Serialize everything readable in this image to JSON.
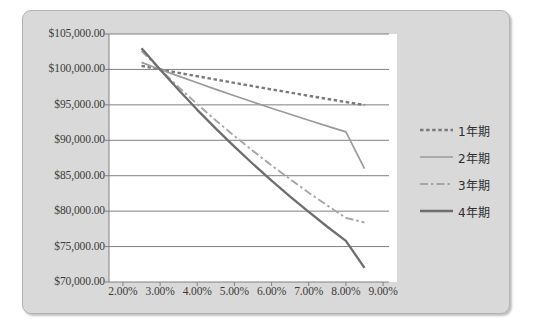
{
  "chart_data": {
    "type": "line",
    "title": "",
    "xlabel": "",
    "ylabel": "",
    "xlim": [
      1.625,
      9.375
    ],
    "ylim": [
      70000,
      105000
    ],
    "grid": true,
    "legend_position": "right",
    "x_ticks": [
      "2.00%",
      "3.00%",
      "4.00%",
      "5.00%",
      "6.00%",
      "7.00%",
      "8.00%",
      "9.00%"
    ],
    "x_tick_values": [
      2,
      3,
      4,
      5,
      6,
      7,
      8,
      9
    ],
    "y_ticks": [
      "$70,000.00",
      "$75,000.00",
      "$80,000.00",
      "$85,000.00",
      "$90,000.00",
      "$95,000.00",
      "$100,000.00",
      "$105,000.00"
    ],
    "y_tick_values": [
      70000,
      75000,
      80000,
      85000,
      90000,
      95000,
      100000,
      105000
    ],
    "x": [
      2.5,
      3.0,
      3.5,
      4.0,
      4.5,
      5.0,
      5.5,
      6.0,
      6.5,
      7.0,
      7.5,
      8.0,
      8.5
    ],
    "series": [
      {
        "name": "1年期",
        "style": "dotted",
        "color": "#7a7a7a",
        "values": [
          100500,
          100000,
          99520,
          99040,
          98570,
          98100,
          97640,
          97180,
          96730,
          96280,
          95840,
          95400,
          94970
        ]
      },
      {
        "name": "2年期",
        "style": "solid-light",
        "color": "#9a9a9a",
        "values": [
          101000,
          100000,
          99050,
          98110,
          97190,
          96290,
          95400,
          94530,
          93670,
          92830,
          92000,
          91190,
          86000
        ]
      },
      {
        "name": "3年期",
        "style": "dash-dot",
        "color": "#a6a6a6",
        "values": [
          102600,
          100000,
          97500,
          95100,
          92800,
          90600,
          88500,
          86450,
          84500,
          82600,
          80800,
          79050,
          78400
        ]
      },
      {
        "name": "4年期",
        "style": "solid-dark",
        "color": "#6e6e6e",
        "values": [
          103000,
          100000,
          97100,
          94300,
          91650,
          89100,
          86650,
          84300,
          82050,
          79900,
          77800,
          75800,
          72000
        ]
      }
    ]
  },
  "legend": {
    "items": [
      {
        "label": "1年期",
        "style": "dotted"
      },
      {
        "label": "2年期",
        "style": "solid-light"
      },
      {
        "label": "3年期",
        "style": "dash-dot"
      },
      {
        "label": "4年期",
        "style": "solid-dark"
      }
    ]
  },
  "colors": {
    "frame_background": "#d9d9d9",
    "plot_background": "#ffffff",
    "gridline": "#808080",
    "axis": "#808080",
    "text": "#3b3b3b"
  }
}
